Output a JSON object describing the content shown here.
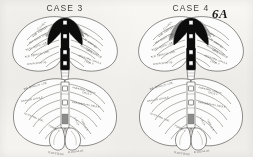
{
  "figure": {
    "number_label": "6A",
    "background_color": "#f2f1ee",
    "ink_color": "#33312f",
    "lesion_black": "#111111",
    "lesion_gray": "#8d8d8d"
  },
  "panels": [
    {
      "id": "case-3",
      "title": "CASE 3",
      "upper_left_labels": [
        "CULMEN",
        "LOB. SIMPLEX",
        "ANT. QUAD. LOB.",
        "POST. QUAD. LOB.",
        "SUP. SEMILUN. LOB.",
        "ANSIFORM LOB."
      ],
      "upper_right_labels": [
        "CULMEN",
        "LOB. SIMPLEX",
        "ANSIFORM LOBULE",
        "CRUS I",
        "ANSIFORM LOBULE",
        "CRUS II"
      ],
      "lower_left_labels": [
        "INF. SEMILUN. LOB.",
        "GRACILE LOBULE",
        "TONSILLA",
        "BIVENTRAL LOB.",
        "FLOCCULUS"
      ],
      "lower_right_labels": [
        "ANSIFORM LOBULE",
        "CRUS II",
        "PARAMEDIAN LOBULE",
        "UVULA",
        "NODULUS",
        "FLOCCULUS"
      ],
      "vermis_labels": [
        "IV",
        "V",
        "VI",
        "VII",
        "VIII",
        "IX"
      ],
      "lesion_description": "black vermal lesion with gray penumbra, symmetric wings"
    },
    {
      "id": "case-4",
      "title": "CASE 4",
      "upper_left_labels": [
        "CULMEN",
        "LOB. SIMPLEX",
        "ANT. QUAD. LOB.",
        "POST. QUAD. LOB.",
        "SUP. SEMILUN. LOB.",
        "ANSIFORM LOB."
      ],
      "upper_right_labels": [
        "CULMEN",
        "LOB. SIMPLEX",
        "ANSIFORM LOBULE",
        "CRUS I",
        "ANSIFORM LOBULE",
        "CRUS II"
      ],
      "lower_left_labels": [
        "INF. SEMILUN. LOB.",
        "GRACILE LOBULE",
        "TONSILLA",
        "BIVENTRAL LOB.",
        "FLOCCULUS"
      ],
      "lower_right_labels": [
        "ANSIFORM LOBULE",
        "CRUS II",
        "PARAMEDIAN LOBULE",
        "UVULA",
        "NODULUS",
        "FLOCCULUS"
      ],
      "vermis_labels": [
        "IV",
        "V",
        "VI",
        "VII",
        "VIII",
        "IX"
      ],
      "lesion_description": "black vermal lesion with broader gray shading on left wing"
    }
  ]
}
